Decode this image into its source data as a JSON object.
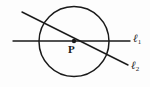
{
  "figure": {
    "type": "geometry-diagram",
    "background_color": "#fdfdfd",
    "stroke_color": "#1a1a1a",
    "point": {
      "label": "P",
      "x": 74,
      "y": 41,
      "marker": "filled-dot"
    },
    "circle": {
      "center_x": 74,
      "center_y": 41.5,
      "radius": 35,
      "stroke_width": 1.5
    },
    "lines": [
      {
        "id": "l1",
        "label": "ℓ",
        "subscript": "1",
        "orientation": "horizontal",
        "x1": 13,
        "y1": 41,
        "x2": 130,
        "y2": 41,
        "stroke_width": 1.4
      },
      {
        "id": "l2",
        "label": "ℓ",
        "subscript": "2",
        "orientation": "diagonal",
        "x1": 22,
        "y1": 12,
        "x2": 128,
        "y2": 65,
        "stroke_width": 1.4
      }
    ]
  }
}
